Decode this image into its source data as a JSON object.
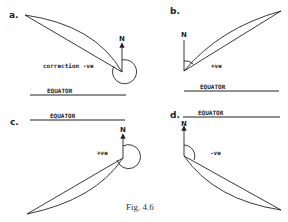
{
  "figure": {
    "caption": "Fig. 4.6",
    "panels": [
      {
        "id": "a",
        "label": "a.",
        "north_label": "N",
        "sign_label": "correction -ve",
        "equator_label": "EQUATOR"
      },
      {
        "id": "b",
        "label": "b.",
        "north_label": "N",
        "sign_label": "+ve",
        "equator_label": "EQUATOR"
      },
      {
        "id": "c",
        "label": "c.",
        "north_label": "N",
        "sign_label": "+ve",
        "equator_label": "EQUATOR"
      },
      {
        "id": "d",
        "label": "d.",
        "north_label": "N",
        "sign_label": "-ve",
        "equator_label": "EQUATOR"
      }
    ]
  }
}
